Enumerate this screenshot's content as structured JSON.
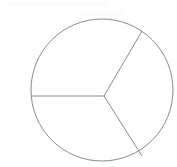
{
  "figure": {
    "caption": "A thin grey outlined circle partitioned by three radii into three pie-shaped sectors.",
    "background_color": "#ffffff",
    "stroke_color": "#8a8a8a",
    "stroke_color_light": "#9a9a9a",
    "stroke_width": 1,
    "canvas": {
      "width": 177,
      "height": 167
    },
    "circle": {
      "center_x": 102,
      "center_y": 90,
      "radius": 71,
      "label": "circle-outline"
    },
    "vertex": {
      "x": 104,
      "y": 96,
      "label": "sector-center-vertex"
    },
    "radii": [
      {
        "name": "radius-left",
        "angle_degrees": 180,
        "end_x": 31,
        "end_y": 96
      },
      {
        "name": "radius-upper-right",
        "angle_degrees": -42,
        "end_x": 142,
        "end_y": 31
      },
      {
        "name": "radius-lower-right",
        "angle_degrees": 60,
        "end_x": 142,
        "end_y": 156
      }
    ],
    "sectors": [
      {
        "name": "sector-top",
        "label": "",
        "from_angle_degrees": 180,
        "to_angle_degrees": -42,
        "fill": "none"
      },
      {
        "name": "sector-right",
        "label": "",
        "from_angle_degrees": -42,
        "to_angle_degrees": 60,
        "fill": "none"
      },
      {
        "name": "sector-bottom-left",
        "label": "",
        "from_angle_degrees": 60,
        "to_angle_degrees": 180,
        "fill": "none"
      }
    ]
  },
  "chart_data": {
    "type": "pie",
    "title": "",
    "categories": [
      "Sector 1",
      "Sector 2",
      "Sector 3"
    ],
    "values": [
      34,
      28,
      38
    ],
    "labels_shown": false,
    "legend": [],
    "legend_position": "none",
    "grid": false,
    "annotations": []
  }
}
